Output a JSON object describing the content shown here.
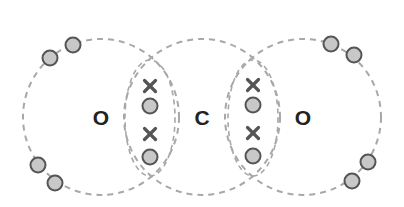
{
  "diagram": {
    "title": "",
    "type": "dot-and-cross",
    "colors": {
      "shell_stroke": "#a8a8a8",
      "electron_fill": "#c8c8c8",
      "electron_stroke": "#555555",
      "cross_stroke": "#555555",
      "label_color": "#222222"
    },
    "atoms": [
      {
        "id": "oxygen-left",
        "label": "O",
        "cx": 101,
        "cy": 117,
        "r": 78
      },
      {
        "id": "carbon",
        "label": "C",
        "cx": 202,
        "cy": 117,
        "r": 78
      },
      {
        "id": "oxygen-right",
        "label": "O",
        "cx": 303,
        "cy": 117,
        "r": 78
      }
    ],
    "lone_pair_electrons": [
      {
        "atom": "oxygen-left",
        "x": 50,
        "y": 58
      },
      {
        "atom": "oxygen-left",
        "x": 73,
        "y": 45
      },
      {
        "atom": "oxygen-left",
        "x": 38,
        "y": 165
      },
      {
        "atom": "oxygen-left",
        "x": 55,
        "y": 183
      },
      {
        "atom": "oxygen-right",
        "x": 331,
        "y": 44
      },
      {
        "atom": "oxygen-right",
        "x": 354,
        "y": 55
      },
      {
        "atom": "oxygen-right",
        "x": 368,
        "y": 162
      },
      {
        "atom": "oxygen-right",
        "x": 352,
        "y": 181
      }
    ],
    "shared_bonds": [
      {
        "between": [
          "oxygen-left",
          "carbon"
        ],
        "x": 150,
        "crosses": [
          86,
          134
        ],
        "dots": [
          106,
          157
        ]
      },
      {
        "between": [
          "carbon",
          "oxygen-right"
        ],
        "x": 253,
        "crosses": [
          85,
          133
        ],
        "dots": [
          105,
          156
        ]
      }
    ],
    "legend": {
      "dot": "electron (oxygen)",
      "cross": "electron (carbon)"
    }
  }
}
